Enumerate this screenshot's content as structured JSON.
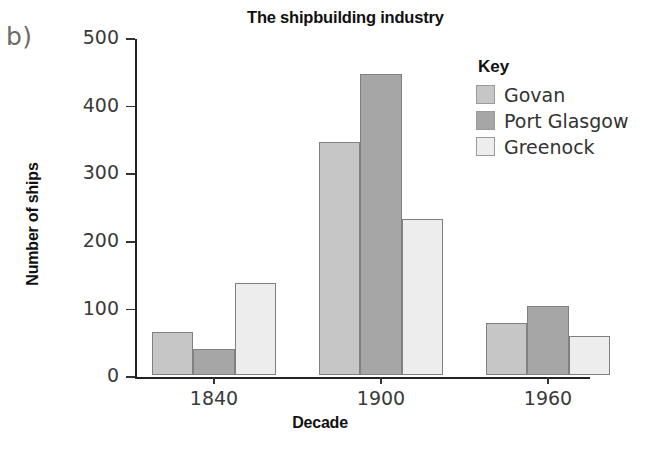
{
  "panel_label": "b)",
  "legend": {
    "title": "Key",
    "entries": [
      {
        "label": "Govan",
        "color": "#c6c6c6"
      },
      {
        "label": "Port Glasgow",
        "color": "#a6a6a6"
      },
      {
        "label": "Greenock",
        "color": "#ededed"
      }
    ]
  },
  "chart_data": {
    "type": "bar",
    "title": "The shipbuilding industry",
    "xlabel": "Decade",
    "ylabel": "Number of ships",
    "categories": [
      "1840",
      "1900",
      "1960"
    ],
    "series": [
      {
        "name": "Govan",
        "color": "#c6c6c6",
        "values": [
          64,
          345,
          77
        ]
      },
      {
        "name": "Port Glasgow",
        "color": "#a6a6a6",
        "values": [
          38,
          445,
          102
        ]
      },
      {
        "name": "Greenock",
        "color": "#ededed",
        "values": [
          136,
          231,
          58
        ]
      }
    ],
    "ylim": [
      0,
      500
    ],
    "yticks": [
      0,
      100,
      200,
      300,
      400,
      500
    ],
    "ytick_labels": [
      "0",
      "100",
      "200",
      "300",
      "400",
      "500"
    ],
    "grid": false,
    "legend_position": "right"
  }
}
